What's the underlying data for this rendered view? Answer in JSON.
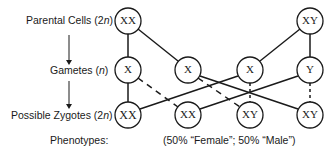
{
  "rows": {
    "parental": {
      "label": "Parental Cells (2",
      "var": "n",
      "suffix": ")"
    },
    "gametes": {
      "label": "Gametes (",
      "var": "n",
      "suffix": ")"
    },
    "zygotes": {
      "label": "Possible Zygotes (2",
      "var": "n",
      "suffix": ")"
    },
    "phenotypes": {
      "label": "Phenotypes:"
    }
  },
  "phenotype_result": "(50% “Female”; 50% “Male”)",
  "nodes": {
    "parent_female": "XX",
    "parent_male": "XY",
    "gamete_1": "X",
    "gamete_2": "X",
    "gamete_3": "X",
    "gamete_4": "Y",
    "zygote_1": "XX",
    "zygote_2": "XX",
    "zygote_3": "XY",
    "zygote_4": "XY"
  },
  "colors": {
    "stroke": "#1a1a1a",
    "background": "#ffffff"
  }
}
